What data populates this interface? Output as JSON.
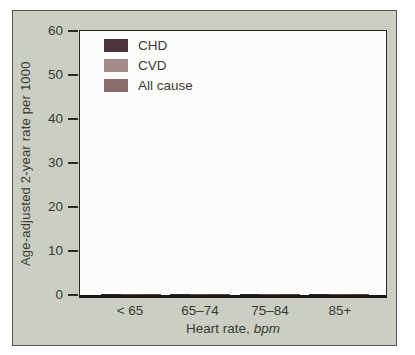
{
  "figure": {
    "background": "#cbcfc3",
    "panel_background": "#fcfcfa",
    "frame_border": "#56564e",
    "axis_color": "#2b2b26",
    "text_color": "#3a3a33"
  },
  "chart_data": {
    "type": "bar",
    "categories": [
      "< 65",
      "65–74",
      "75–84",
      "85+"
    ],
    "series": [
      {
        "name": "CHD",
        "color": "#4b343a",
        "values": [
          9,
          11,
          14.5,
          19
        ]
      },
      {
        "name": "CVD",
        "color": "#a68b8b",
        "values": [
          16,
          14.5,
          21,
          26.5
        ]
      },
      {
        "name": "All cause",
        "color": "#8a6e6f",
        "values": [
          25,
          28.5,
          36.5,
          52.5
        ]
      }
    ],
    "xlabel": "Heart rate, bpm",
    "xlabel_text": "Heart rate,",
    "xlabel_italic": "bpm",
    "ylabel": "Age-adjusted 2-year rate per 1000",
    "ylim": [
      0,
      60
    ],
    "yticks": [
      0,
      10,
      20,
      30,
      40,
      50,
      60
    ],
    "grid": false,
    "legend_position": "top-left"
  }
}
